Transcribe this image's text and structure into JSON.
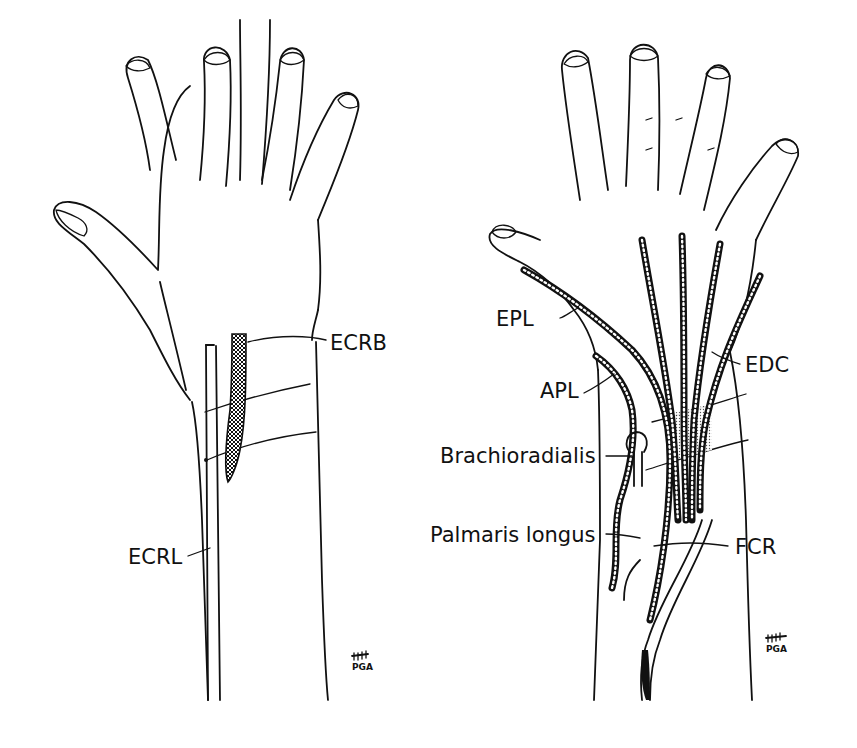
{
  "figure": {
    "left_panel": {
      "view": "dorsal hand and forearm",
      "labels": {
        "ecrb": "ECRB",
        "ecrl": "ECRL"
      },
      "signature": "PGA"
    },
    "right_panel": {
      "view": "dorsal hand and forearm with tendons",
      "labels": {
        "epl": "EPL",
        "apl": "APL",
        "brachioradialis": "Brachioradialis",
        "palmaris_longus": "Palmaris longus",
        "edc": "EDC",
        "fcr": "FCR"
      },
      "signature": "PGA"
    },
    "colors": {
      "ink": "#111111",
      "background": "#ffffff"
    }
  }
}
